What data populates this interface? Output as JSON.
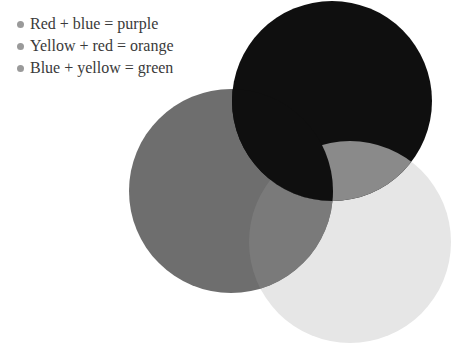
{
  "list": {
    "items": [
      {
        "text": "Red + blue = purple"
      },
      {
        "text": "Yellow + red = orange"
      },
      {
        "text": "Blue + yellow = green"
      }
    ]
  },
  "diagram": {
    "type": "venn-overlapping-circles",
    "circles": [
      {
        "name": "dark-circle",
        "cx": 332,
        "cy": 101,
        "r": 100,
        "color": "#0f0f0f"
      },
      {
        "name": "gray-circle",
        "cx": 231,
        "cy": 191,
        "r": 102,
        "color": "#6e6e6e"
      },
      {
        "name": "light-circle",
        "cx": 350,
        "cy": 242,
        "r": 101,
        "color": "#e6e6e6"
      }
    ],
    "overlap_colors": {
      "dark_gray": "#0f0f0f",
      "dark_light": "#8a8a8a",
      "gray_light": "#7a7a7a"
    }
  }
}
